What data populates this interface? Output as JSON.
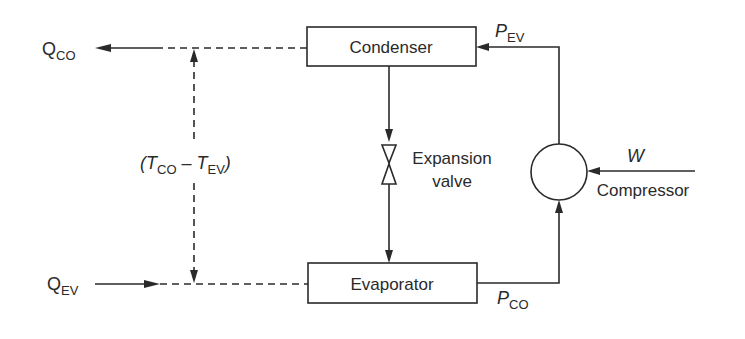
{
  "diagram": {
    "type": "refrigeration-cycle-block-diagram",
    "nodes": {
      "condenser": {
        "label": "Condenser"
      },
      "evaporator": {
        "label": "Evaporator"
      },
      "expansion_valve": {
        "label_line1": "Expansion",
        "label_line2": "valve"
      },
      "compressor": {
        "label": "Compressor"
      }
    },
    "labels": {
      "q_co": {
        "main": "Q",
        "sub": "CO"
      },
      "q_ev": {
        "main": "Q",
        "sub": "EV"
      },
      "p_ev": {
        "main": "P",
        "sub": "EV"
      },
      "p_co": {
        "main": "P",
        "sub": "CO"
      },
      "w": {
        "main": "W"
      },
      "temp_diff": {
        "open": "(",
        "t1_main": "T",
        "t1_sub": "CO",
        "minus": " – ",
        "t2_main": "T",
        "t2_sub": "EV",
        "close": ")"
      }
    },
    "edges": [
      {
        "from": "condenser",
        "to": "Q_CO",
        "style": "dashed-to-solid-arrow"
      },
      {
        "from": "Q_EV",
        "to": "evaporator",
        "style": "solid-arrow-to-dashed"
      },
      {
        "from": "condenser",
        "to": "expansion_valve",
        "style": "solid-arrow"
      },
      {
        "from": "expansion_valve",
        "to": "evaporator",
        "style": "solid-arrow"
      },
      {
        "from": "evaporator",
        "to": "compressor",
        "style": "solid-arrow",
        "label": "P_CO"
      },
      {
        "from": "compressor",
        "to": "condenser",
        "style": "solid-arrow",
        "label": "P_EV"
      },
      {
        "from": "W",
        "to": "compressor",
        "style": "solid-arrow"
      },
      {
        "from": "temp_diff",
        "to": "both-dashed-lines",
        "style": "dashed-double-arrow"
      }
    ],
    "colors": {
      "ink": "#2a2a2a",
      "background": "#ffffff"
    }
  }
}
